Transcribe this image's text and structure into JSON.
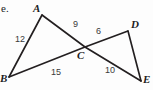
{
  "figure": {
    "item_label": "e.",
    "background_color": "#fdfdfd",
    "line_color": "#231f20",
    "label_color": "#2b2b2b",
    "vertices": [
      {
        "name": "A",
        "label": "A",
        "x": 42,
        "y": 15,
        "label_x": 33,
        "label_y": 3
      },
      {
        "name": "B",
        "label": "B",
        "x": 9,
        "y": 77,
        "label_x": 0,
        "label_y": 73
      },
      {
        "name": "C",
        "label": "C",
        "x": 85,
        "y": 47,
        "label_x": 77,
        "label_y": 50
      },
      {
        "name": "D",
        "label": "D",
        "x": 128,
        "y": 31,
        "label_x": 131,
        "label_y": 19
      },
      {
        "name": "E",
        "label": "E",
        "x": 141,
        "y": 81,
        "label_x": 143,
        "label_y": 74
      }
    ],
    "segments": [
      {
        "name": "segment-AB",
        "from": "A",
        "to": "B",
        "measure": "12",
        "label_x": 15,
        "label_y": 35
      },
      {
        "name": "segment-AC",
        "from": "A",
        "to": "C",
        "measure": "9",
        "label_x": 73,
        "label_y": 20
      },
      {
        "name": "segment-BC",
        "from": "B",
        "to": "C",
        "measure": "15",
        "label_x": 51,
        "label_y": 68
      },
      {
        "name": "segment-CD",
        "from": "C",
        "to": "D",
        "measure": "6",
        "label_x": 96,
        "label_y": 27
      },
      {
        "name": "segment-CE",
        "from": "C",
        "to": "E",
        "measure": "10",
        "label_x": 105,
        "label_y": 66
      }
    ],
    "polylines": [
      {
        "name": "line-A-to-E",
        "points": "42,15 85,47 141,81"
      },
      {
        "name": "line-B-to-D",
        "points": "9,77 85,47 128,31"
      },
      {
        "name": "line-A-to-B",
        "points": "42,15 9,77"
      },
      {
        "name": "line-D-to-E",
        "points": "128,31 141,81"
      }
    ]
  }
}
